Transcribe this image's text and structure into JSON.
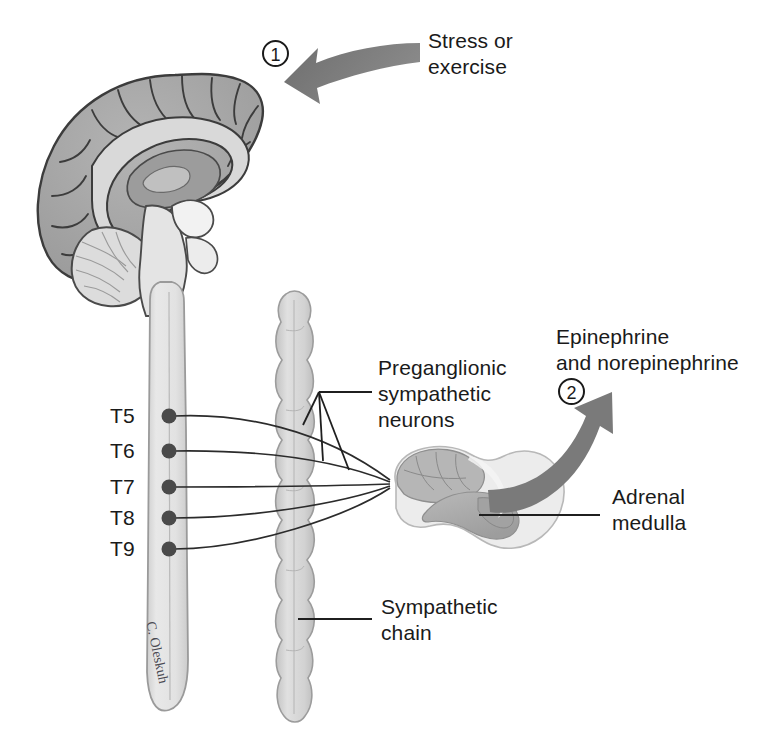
{
  "figure": {
    "background_color": "#ffffff",
    "width": 762,
    "height": 750
  },
  "annotations": {
    "step1": {
      "marker": "1",
      "label_line1": "Stress or",
      "label_line2": "exercise"
    },
    "step2": {
      "marker": "2",
      "label_line1": "Epinephrine",
      "label_line2": "and norepinephrine"
    },
    "preganglionic": {
      "line1": "Preganglionic",
      "line2": "sympathetic",
      "line3": "neurons"
    },
    "adrenal": {
      "line1": "Adrenal",
      "line2": "medulla"
    },
    "sympathetic_chain": {
      "line1": "Sympathetic",
      "line2": "chain"
    },
    "signature": "C. Oleskuh"
  },
  "spinal_levels": [
    {
      "id": "t5",
      "label": "T5"
    },
    {
      "id": "t6",
      "label": "T6"
    },
    {
      "id": "t7",
      "label": "T7"
    },
    {
      "id": "t8",
      "label": "T8"
    },
    {
      "id": "t9",
      "label": "T9"
    }
  ],
  "structures": [
    {
      "id": "brain",
      "name": "brain-midsagittal"
    },
    {
      "id": "spinal-cord",
      "name": "spinal-cord"
    },
    {
      "id": "sympathetic-chain",
      "name": "sympathetic-chain-ganglia"
    },
    {
      "id": "adrenal-gland",
      "name": "adrenal-gland"
    },
    {
      "id": "adrenal-medulla",
      "name": "adrenal-medulla"
    },
    {
      "id": "preganglionic-fibers",
      "name": "preganglionic-nerve-fibers"
    }
  ],
  "colors": {
    "cortex_gray": "#a9a9a9",
    "cortex_gray_dark": "#8e8e8e",
    "white_matter": "#d9d9d9",
    "cord_fill": "#e2e2e2",
    "cord_outline": "#9a9a9a",
    "chain_fill": "#d5d5d5",
    "arrow_gray": "#767676",
    "line_color": "#2b2b2b",
    "text_color": "#1a1a1a",
    "dot_color": "#4a4a4a",
    "adrenal_cortex": "#e8e8e8",
    "adrenal_medulla": "#b0b0b0"
  }
}
